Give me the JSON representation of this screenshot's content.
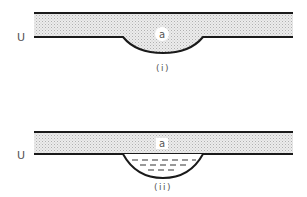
{
  "diagram_i": {
    "layer_label": "a",
    "side_label": "U",
    "caption": "(i)"
  },
  "diagram_ii": {
    "layer_label": "a",
    "side_label": "U",
    "caption": "(ii)"
  },
  "colors": {
    "line": "#1a1a1a",
    "stipple_bg": "#ececec",
    "stipple_dot": "#b5b5b5",
    "label_bg": "#ffffff"
  }
}
